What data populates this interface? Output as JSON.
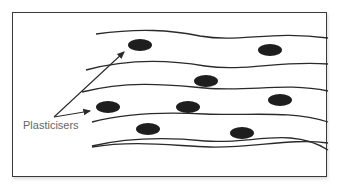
{
  "diagram": {
    "label": "Plasticisers",
    "colors": {
      "border": "#3a3a3a",
      "line": "#2a2a2a",
      "particle": "#1e1e1e",
      "label_text": "#666666"
    },
    "polymer_chains": 6,
    "particles": 8
  }
}
